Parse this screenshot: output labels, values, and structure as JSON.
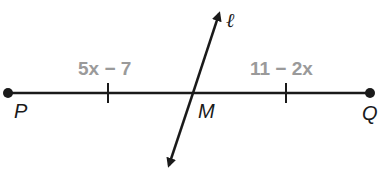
{
  "diagram": {
    "segment": {
      "start_label": "P",
      "end_label": "Q",
      "midpoint_label": "M",
      "left_expression": "5x − 7",
      "right_expression": "11 − 2x"
    },
    "line": {
      "label": "ℓ"
    },
    "colors": {
      "stroke": "#1a1a1a",
      "expression": "#9a9a9a"
    }
  }
}
